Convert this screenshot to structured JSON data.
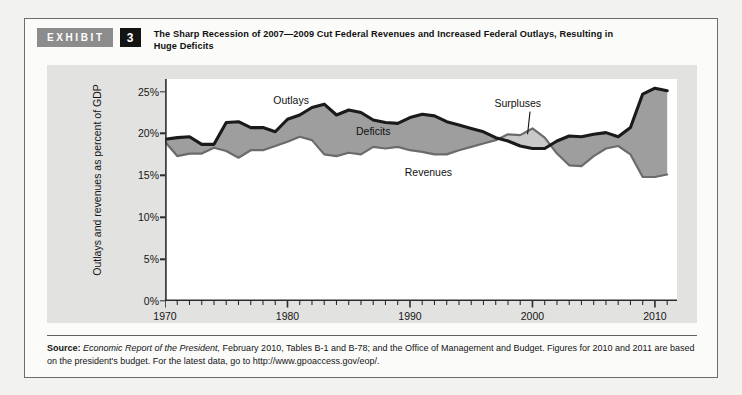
{
  "exhibit": {
    "tag": "EXHIBIT",
    "number": "3",
    "title": "The Sharp Recession of 2007—2009 Cut Federal Revenues and Increased Federal Outlays, Resulting in Huge Deficits"
  },
  "source": {
    "label": "Source:",
    "italic_1": "Economic Report of the President,",
    "rest": " February 2010, Tables B-1 and B-78; and the Office of Management and Budget. Figures for 2010 and 2011 are based on the president's budget. For the latest data, go to http://www.gpoaccess.gov/eop/."
  },
  "colors": {
    "panel_bg": "#e2e2e0",
    "plot_bg": "#ffffff",
    "deficit_fill": "#9e9e9e",
    "surplus_fill": "#c9c9c9",
    "outlays_line": "#1a1a1a",
    "revenues_line": "#6b6b6b",
    "tag_bg": "#8c8c8c",
    "number_bg": "#141414"
  },
  "chart_data": {
    "type": "area",
    "title": "The Sharp Recession of 2007—2009 Cut Federal Revenues and Increased Federal Outlays, Resulting in Huge Deficits",
    "xlabel": "",
    "ylabel": "Outlays and revenues as percent of GDP",
    "xlim": [
      1970,
      2011.8
    ],
    "ylim": [
      0,
      26.5
    ],
    "grid": false,
    "legend": "inline-annotations",
    "y_ticks": [
      0,
      5,
      10,
      15,
      20,
      25
    ],
    "y_tick_labels": [
      "0%",
      "5%",
      "10%",
      "15%",
      "20%",
      "25%"
    ],
    "x_ticks": [
      1970,
      1980,
      1990,
      2000,
      2010
    ],
    "x_tick_labels": [
      "1970",
      "1980",
      "1990",
      "2000",
      "2010"
    ],
    "x_minor_tick_step": 1,
    "annotations": [
      {
        "text": "Outlays",
        "x": 1980.3,
        "y": 24.0
      },
      {
        "text": "Deficits",
        "x": 1987.0,
        "y": 20.3
      },
      {
        "text": "Revenues",
        "x": 1991.5,
        "y": 15.4
      },
      {
        "text": "Surpluses",
        "x": 1998.8,
        "y": 23.6
      }
    ],
    "annotation_leader": {
      "from": [
        1999.8,
        22.6
      ],
      "to": [
        1999.6,
        19.9
      ]
    },
    "x": [
      1970,
      1971,
      1972,
      1973,
      1974,
      1975,
      1976,
      1977,
      1978,
      1979,
      1980,
      1981,
      1982,
      1983,
      1984,
      1985,
      1986,
      1987,
      1988,
      1989,
      1990,
      1991,
      1992,
      1993,
      1994,
      1995,
      1996,
      1997,
      1998,
      1999,
      2000,
      2001,
      2002,
      2003,
      2004,
      2005,
      2006,
      2007,
      2008,
      2009,
      2010,
      2011
    ],
    "series": [
      {
        "name": "Outlays",
        "values": [
          19.3,
          19.5,
          19.6,
          18.7,
          18.7,
          21.3,
          21.4,
          20.7,
          20.7,
          20.2,
          21.7,
          22.2,
          23.1,
          23.5,
          22.2,
          22.8,
          22.5,
          21.6,
          21.3,
          21.2,
          21.9,
          22.3,
          22.1,
          21.4,
          21.0,
          20.6,
          20.2,
          19.5,
          19.1,
          18.5,
          18.2,
          18.2,
          19.1,
          19.7,
          19.6,
          19.9,
          20.1,
          19.6,
          20.7,
          24.7,
          25.4,
          25.1
        ]
      },
      {
        "name": "Revenues",
        "values": [
          19.0,
          17.3,
          17.6,
          17.6,
          18.3,
          17.9,
          17.1,
          18.0,
          18.0,
          18.5,
          19.0,
          19.6,
          19.2,
          17.5,
          17.3,
          17.7,
          17.5,
          18.4,
          18.2,
          18.4,
          18.0,
          17.8,
          17.5,
          17.5,
          18.0,
          18.4,
          18.8,
          19.2,
          19.9,
          19.8,
          20.6,
          19.5,
          17.6,
          16.2,
          16.1,
          17.3,
          18.2,
          18.5,
          17.5,
          14.8,
          14.8,
          15.1
        ]
      }
    ]
  }
}
